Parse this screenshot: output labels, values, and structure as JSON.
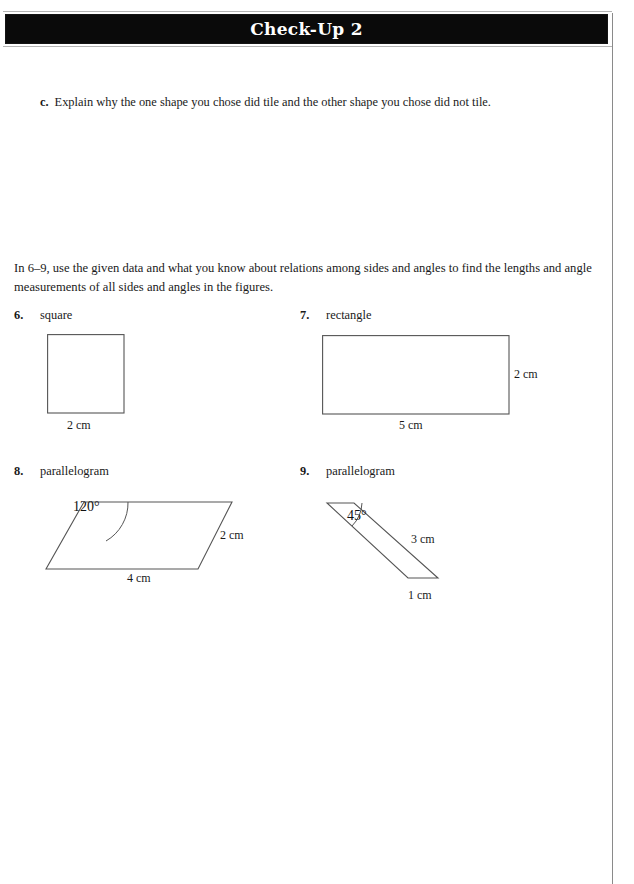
{
  "header": {
    "title": "Check-Up 2"
  },
  "question_c": {
    "label": "c.",
    "text": "Explain why the one shape you chose did tile and the other shape you chose did not tile."
  },
  "intro": {
    "text": "In 6–9, use the given data and what you know about relations among sides and angles to find the lengths and angle measurements of all sides and angles in the figures."
  },
  "problems": [
    {
      "number": "6.",
      "name": "square",
      "figure": {
        "type": "square",
        "labels": {
          "bottom": "2 cm"
        }
      }
    },
    {
      "number": "7.",
      "name": "rectangle",
      "figure": {
        "type": "rectangle",
        "labels": {
          "right": "2 cm",
          "bottom": "5 cm"
        }
      }
    },
    {
      "number": "8.",
      "name": "parallelogram",
      "figure": {
        "type": "parallelogram",
        "labels": {
          "angle": "120°",
          "right": "2 cm",
          "bottom": "4 cm"
        }
      }
    },
    {
      "number": "9.",
      "name": "parallelogram",
      "figure": {
        "type": "parallelogram",
        "labels": {
          "angle": "45°",
          "right": "3 cm",
          "bottom": "1 cm"
        }
      }
    }
  ],
  "colors": {
    "banner_background": "#0a0a0a",
    "banner_text": "#ffffff",
    "page_background": "#ffffff",
    "figure_stroke": "#555555",
    "body_text": "#1a1a1a",
    "rule": "#8a8a8a"
  }
}
